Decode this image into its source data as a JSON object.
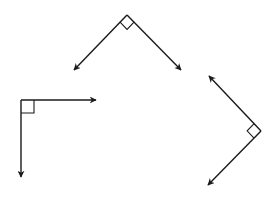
{
  "diagram": {
    "title": "",
    "stroke_color": "#1a1a1a",
    "background_color": "#ffffff",
    "angles": [
      {
        "id": "top-angle",
        "measure": "90°",
        "vertex": [
          127,
          15
        ],
        "ray_ends": [
          [
            74,
            70
          ],
          [
            181,
            70
          ]
        ],
        "marker_size": 10
      },
      {
        "id": "left-angle",
        "measure": "90°",
        "vertex": [
          21,
          100
        ],
        "ray_ends": [
          [
            96,
            100
          ],
          [
            21,
            177
          ]
        ],
        "marker_size": 13
      },
      {
        "id": "right-angle",
        "measure": "90°",
        "vertex": [
          261,
          131
        ],
        "ray_ends": [
          [
            209,
            76
          ],
          [
            208,
            185
          ]
        ],
        "marker_size": 10
      }
    ]
  }
}
